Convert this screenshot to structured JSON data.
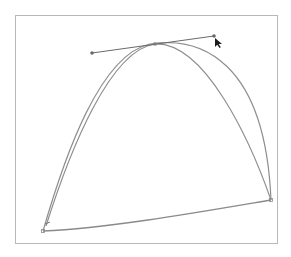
{
  "diagram": {
    "type": "bezier-curve-editing",
    "colors": {
      "curve": "#8a8a8a",
      "handle_line": "#6a6a6a",
      "frame": "#b8b8b8",
      "cursor": "#1a1a1a",
      "background": "#ffffff"
    },
    "anchors": [
      {
        "id": "bottom-left",
        "x": 43,
        "y": 231
      },
      {
        "id": "apex",
        "x": 155,
        "y": 44
      },
      {
        "id": "bottom-right",
        "x": 271,
        "y": 200
      }
    ],
    "handles": [
      {
        "id": "left-handle",
        "x": 92,
        "y": 53
      },
      {
        "id": "right-handle",
        "x": 214,
        "y": 36
      }
    ],
    "cursor": {
      "icon": "arrow-pointer-icon",
      "x": 215,
      "y": 38
    }
  }
}
